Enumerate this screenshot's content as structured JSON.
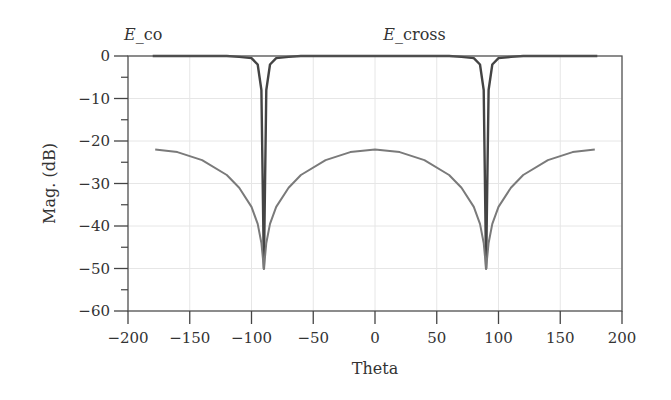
{
  "chart_data": {
    "type": "line",
    "title": "",
    "xlabel": "Theta",
    "ylabel": "Mag. (dB)",
    "xlim": [
      -200,
      200
    ],
    "ylim": [
      -60,
      0
    ],
    "xticks": [
      -200,
      -150,
      -100,
      -50,
      0,
      50,
      100,
      150,
      200
    ],
    "yticks": [
      0,
      -10,
      -20,
      -30,
      -40,
      -50,
      -60
    ],
    "xtick_labels": [
      "−200",
      "−150",
      "−100",
      "−50",
      "0",
      "50",
      "100",
      "150",
      "200"
    ],
    "ytick_labels": [
      "0",
      "−10",
      "−20",
      "−30",
      "−40",
      "−50",
      "−60"
    ],
    "grid": true,
    "legend": "none",
    "annotations": [
      {
        "text_italic": "E",
        "text": "_co",
        "x": -200,
        "y": 3
      },
      {
        "text_italic": "E",
        "text": "_cross",
        "x": 10,
        "y": 3
      }
    ],
    "series": [
      {
        "name": "E_co",
        "color": "#444444",
        "x": [
          -180,
          -120,
          -110,
          -100,
          -95,
          -92,
          -90,
          -88,
          -85,
          -80,
          -70,
          -60,
          0,
          60,
          70,
          80,
          85,
          88,
          90,
          92,
          95,
          100,
          110,
          120,
          180
        ],
        "values": [
          0,
          0,
          -0.2,
          -0.5,
          -2,
          -8,
          -50,
          -8,
          -2,
          -0.5,
          -0.2,
          0,
          0,
          0,
          -0.2,
          -0.5,
          -2,
          -8,
          -50,
          -8,
          -2,
          -0.5,
          -0.2,
          0,
          0
        ]
      },
      {
        "name": "E_cross",
        "color": "#7a7a7a",
        "x": [
          -178,
          -160,
          -140,
          -120,
          -110,
          -100,
          -95,
          -92,
          -90,
          -88,
          -85,
          -80,
          -70,
          -60,
          -40,
          -20,
          0,
          20,
          40,
          60,
          70,
          80,
          85,
          88,
          90,
          92,
          95,
          100,
          110,
          120,
          140,
          160,
          178
        ],
        "values": [
          -22,
          -22.6,
          -24.5,
          -28,
          -31,
          -35.5,
          -39.5,
          -44,
          -50,
          -44,
          -39.5,
          -35.5,
          -31,
          -28,
          -24.5,
          -22.6,
          -22,
          -22.6,
          -24.5,
          -28,
          -31,
          -35.5,
          -39.5,
          -44,
          -50,
          -44,
          -39.5,
          -35.5,
          -31,
          -28,
          -24.5,
          -22.6,
          -22
        ]
      }
    ]
  }
}
